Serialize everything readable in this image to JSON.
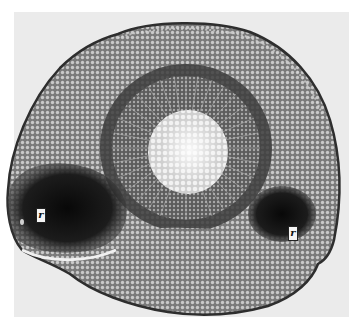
{
  "image": {
    "subject": "cross-section micrograph",
    "labels": [
      {
        "id": "left-root-trace",
        "text": "r",
        "x": 36,
        "y": 208
      },
      {
        "id": "right-root-trace",
        "text": "r",
        "x": 288,
        "y": 226
      }
    ],
    "colors": {
      "background": "#ebebeb",
      "cortex": "#8a8a8a",
      "dark_ring": "#3a3a3a",
      "vascular": "#6b6b6b",
      "pith": "#e6e6e6",
      "root_trace": "#141414"
    }
  }
}
